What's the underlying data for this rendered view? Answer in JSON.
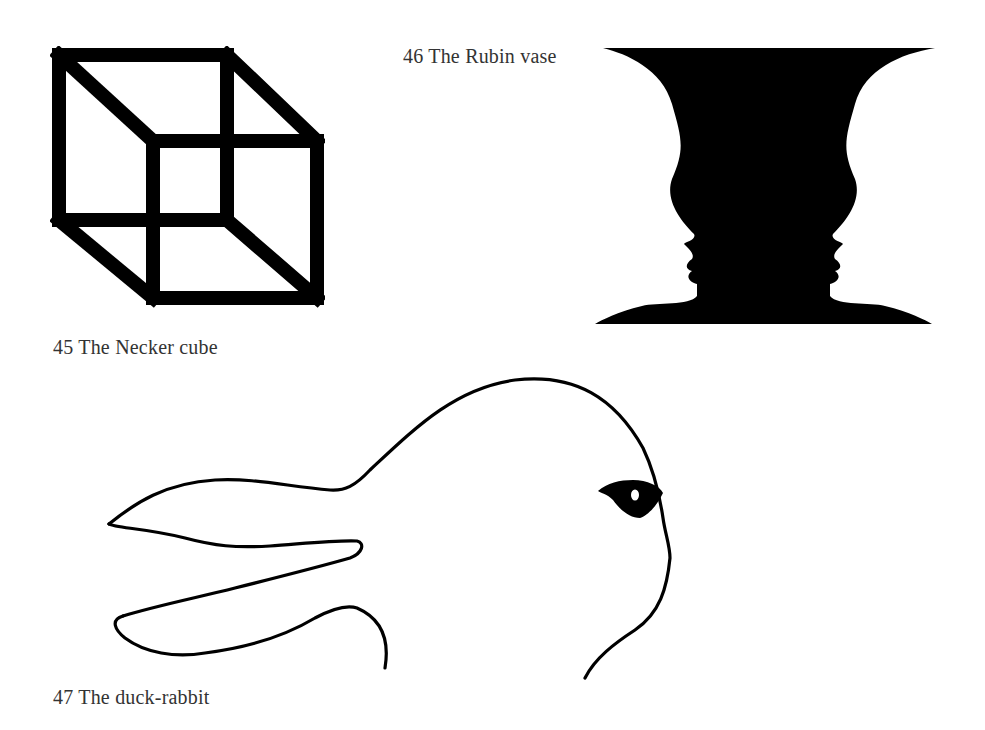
{
  "page": {
    "background": "#ffffff",
    "ink_color": "#000000",
    "caption_color": "#333333"
  },
  "figures": [
    {
      "number": "45",
      "title": "The Necker cube",
      "caption": "45 The Necker cube",
      "icon": "necker-cube-illustration"
    },
    {
      "number": "46",
      "title": "The Rubin vase",
      "caption": "46 The Rubin vase",
      "icon": "rubin-vase-illustration"
    },
    {
      "number": "47",
      "title": "The duck-rabbit",
      "caption": "47 The duck-rabbit",
      "icon": "duck-rabbit-illustration"
    }
  ]
}
